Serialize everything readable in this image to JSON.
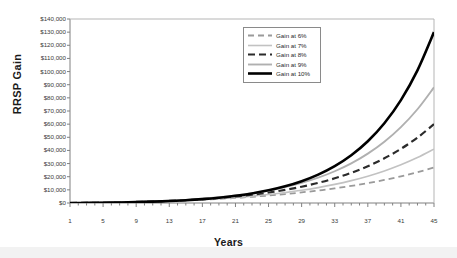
{
  "chart_data": {
    "type": "line",
    "title": "",
    "xlabel": "Years",
    "ylabel": "RRSP  Gain",
    "xlim": [
      1,
      45
    ],
    "ylim": [
      0,
      140000
    ],
    "grid": false,
    "legend_position": "top-center",
    "x_tick_labels": [
      "1",
      "5",
      "9",
      "13",
      "17",
      "21",
      "25",
      "29",
      "33",
      "37",
      "41",
      "45"
    ],
    "x_tick_values": [
      1,
      5,
      9,
      13,
      17,
      21,
      25,
      29,
      33,
      37,
      41,
      45
    ],
    "x_minor_tick_step": 1,
    "y_tick_labels": [
      "$0",
      "$10,000",
      "$20,000",
      "$30,000",
      "$40,000",
      "$50,000",
      "$60,000",
      "$70,000",
      "$80,000",
      "$90,000",
      "$100,000",
      "$110,000",
      "$120,000",
      "$130,000",
      "$140,000"
    ],
    "y_tick_values": [
      0,
      10000,
      20000,
      30000,
      40000,
      50000,
      60000,
      70000,
      80000,
      90000,
      100000,
      110000,
      120000,
      130000,
      140000
    ],
    "x": [
      1,
      3,
      5,
      7,
      9,
      11,
      13,
      15,
      17,
      19,
      21,
      23,
      25,
      27,
      29,
      31,
      33,
      35,
      37,
      39,
      41,
      43,
      45
    ],
    "series": [
      {
        "name": "Gain at 6%",
        "color": "#9a9a9a",
        "style": "dashed",
        "width": 1.8,
        "end_value": 27000,
        "values": [
          0,
          400,
          900,
          1500,
          2300,
          3200,
          4300,
          5600,
          7100,
          8900,
          10900,
          13300,
          16000,
          19100,
          22700,
          26700,
          31300,
          36600,
          42600,
          49400,
          57200,
          66000,
          76000
        ]
      },
      {
        "name": "Gain at 7%",
        "color": "#c2c2c2",
        "style": "solid",
        "width": 1.6,
        "end_value": 41000,
        "values": [
          0,
          450,
          1050,
          1800,
          2750,
          3900,
          5350,
          7100,
          9200,
          11800,
          14900,
          18600,
          23000,
          28300,
          34500,
          41900,
          50600,
          60900,
          73000,
          87300,
          104000,
          123600,
          146600
        ]
      },
      {
        "name": "Gain at 8%",
        "color": "#2b2b2b",
        "style": "dashed",
        "width": 2.2,
        "end_value": 60000,
        "values": [
          0,
          500,
          1200,
          2100,
          3300,
          4800,
          6700,
          9100,
          12000,
          15700,
          20200,
          25700,
          32400,
          40500,
          50300,
          62100,
          76300,
          93300,
          113700,
          138100,
          167300,
          202100,
          243600
        ]
      },
      {
        "name": "Gain at 9%",
        "color": "#b0b0b0",
        "style": "solid",
        "width": 1.9,
        "end_value": 88000,
        "values": [
          0,
          550,
          1350,
          2400,
          3850,
          5750,
          8200,
          11400,
          15400,
          20500,
          26900,
          34900,
          44800,
          57100,
          72300,
          91000,
          114100,
          142500,
          177400,
          220200,
          272700,
          336900,
          415600
        ]
      },
      {
        "name": "Gain at 10%",
        "color": "#000000",
        "style": "solid",
        "width": 2.6,
        "end_value": 130000,
        "values": [
          0,
          600,
          1500,
          2750,
          4500,
          6900,
          10100,
          14400,
          20000,
          27400,
          37000,
          49400,
          65400,
          86000,
          112500,
          146500,
          190200,
          246400,
          318600,
          411400,
          530800,
          684200,
          881400
        ]
      }
    ]
  }
}
